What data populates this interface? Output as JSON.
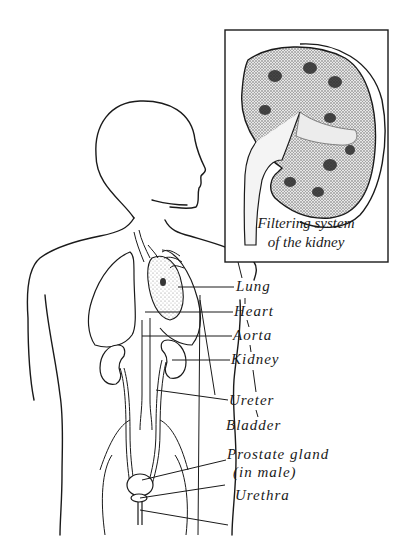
{
  "figure": {
    "inset": {
      "caption_line1": "Filtering system",
      "caption_line2": "of the kidney"
    },
    "labels": [
      {
        "id": "lung",
        "text": "Lung"
      },
      {
        "id": "heart",
        "text": "Heart"
      },
      {
        "id": "aorta",
        "text": "Aorta"
      },
      {
        "id": "kidney",
        "text": "Kidney"
      },
      {
        "id": "ureter",
        "text": "Ureter"
      },
      {
        "id": "bladder",
        "text": "Bladder"
      },
      {
        "id": "prostate",
        "text": "Prostate gland"
      },
      {
        "id": "prostate_note",
        "text": "(in male)"
      },
      {
        "id": "urethra",
        "text": "Urethra"
      }
    ],
    "colors": {
      "line": "#1a1a1a",
      "background": "#ffffff",
      "stipple": "#9a9a9a"
    }
  }
}
